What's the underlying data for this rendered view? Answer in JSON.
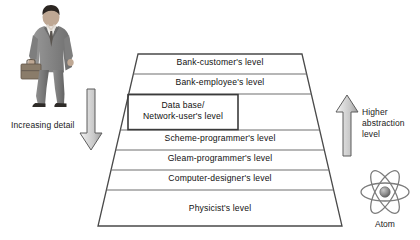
{
  "diagram": {
    "background_color": "#ffffff",
    "line_color": "#555555",
    "text_color": "#111111"
  },
  "figure": {
    "icon": "businessman-with-briefcase-photo"
  },
  "captions": {
    "left": "Increasing\ndetail",
    "right": "Higher\nabstraction\nlevel"
  },
  "arrows": {
    "down": {
      "icon": "down-arrow",
      "direction": "down",
      "fill": "#d9d9d9"
    },
    "up": {
      "icon": "up-arrow",
      "direction": "up",
      "fill": "#d9d9d9"
    }
  },
  "pyramid": {
    "levels": [
      {
        "label": "Bank-customer's level"
      },
      {
        "label": "Bank-employee's level"
      },
      {
        "label": "Data base/\nNetwork-user's level",
        "boxed": true
      },
      {
        "label": "Scheme-programmer's level"
      },
      {
        "label": "Gleam-programmer's level"
      },
      {
        "label": "Computer-designer's level"
      },
      {
        "label": "Physicist's level"
      }
    ]
  },
  "atom": {
    "icon": "atom-icon",
    "label": "Atom",
    "orbits": 3
  }
}
